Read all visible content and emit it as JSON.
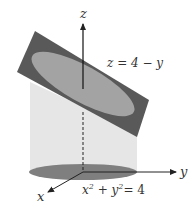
{
  "diagram": {
    "type": "3d-surface-illustration",
    "axes": {
      "x_label": "x",
      "y_label": "y",
      "z_label": "z"
    },
    "plane": {
      "label": "z = 4 − y",
      "color": "#5a5a5a"
    },
    "intersection_ellipse": {
      "color": "#a0a0a0"
    },
    "cylinder": {
      "label_x": "x",
      "label_y": "y",
      "label_rhs": "= 4",
      "exp": "2",
      "color": "#e4e4e4"
    },
    "base_disk": {
      "color": "#7d7d7d"
    }
  }
}
